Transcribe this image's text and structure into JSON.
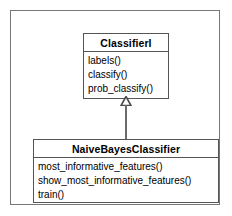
{
  "diagram": {
    "type": "uml-class-diagram",
    "classes": [
      {
        "id": "classifier-i",
        "name": "ClassifierI",
        "stereotype": "interface",
        "members": [
          "labels()",
          "classify()",
          "prob_classify()"
        ]
      },
      {
        "id": "naive-bayes-classifier",
        "name": "NaiveBayesClassifier",
        "stereotype": "class",
        "members": [
          "most_informative_features()",
          "show_most_informative_features()",
          "train()"
        ]
      }
    ],
    "relationships": [
      {
        "type": "generalization",
        "label": "",
        "from": "NaiveBayesClassifier",
        "to": "ClassifierI",
        "arrowhead": "hollow-triangle-icon"
      }
    ],
    "colors": {
      "background": "#ffffff",
      "box_border": "#555555",
      "frame_border": "#777777",
      "connector": "#6b6b6b",
      "text": "#000000"
    }
  }
}
